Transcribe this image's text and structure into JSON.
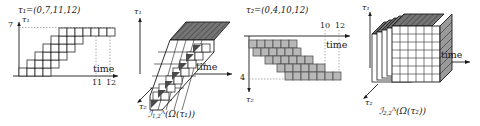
{
  "figure": {
    "kind": "mathematical-diagram",
    "background": "#ffffff",
    "ink": "#1a1a1a",
    "cell_fill_white": "#ffffff",
    "cell_fill_gray": "#b8b8b8",
    "top_face_fill": "#6f6f6f"
  },
  "panels": [
    {
      "id": "panel-1",
      "type": "2d-staircase",
      "sequence_label": "τ₁=(0,7,11,12)",
      "y_axis_name": "τ₁",
      "y_tick": "7",
      "x_axis_name": "time",
      "x_ticks": [
        "11",
        "12"
      ],
      "cell_fill": "white"
    },
    {
      "id": "panel-2",
      "type": "3d-extruded-staircase",
      "vertical_axis_name": "τ₁",
      "depth_axis_name": "τ₂",
      "x_axis_name": "time",
      "caption_main": "ℐ",
      "caption_sub": "1,2",
      "caption_sup": "Λ",
      "caption_arg": "(Ω(τ₁))",
      "caption_full": "ℐ1,2Λ(Ω(τ₁))"
    },
    {
      "id": "panel-3",
      "type": "2d-staircase",
      "sequence_label": "τ₂=(0,4,10,12)",
      "y_axis_name": "τ₂",
      "y_tick": "4",
      "x_axis_name": "time",
      "x_ticks": [
        "10",
        "12"
      ],
      "cell_fill": "gray"
    },
    {
      "id": "panel-4",
      "type": "3d-stacked-slabs",
      "vertical_axis_name": "τ₁",
      "depth_axis_name": "τ₂",
      "x_axis_name": "time",
      "caption_main": "ℐ",
      "caption_sub": "2,2",
      "caption_sup": "Λ",
      "caption_arg": "(Ω(τ₂))",
      "caption_full": "ℐ2,2Λ(Ω(τ₂))"
    }
  ]
}
